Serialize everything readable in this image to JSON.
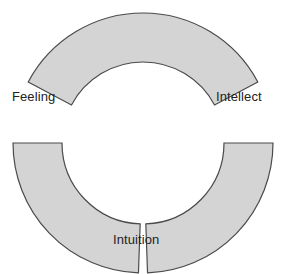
{
  "diagram": {
    "background_color": "#ffffff",
    "center": {
      "x": 143,
      "y": 143
    },
    "radii": {
      "outer": 130,
      "inner": 81
    },
    "segment_fill_color": "#d4d4d4",
    "segment_stroke_color": "#4a4a4a",
    "segment_stroke_width": 1.2,
    "segments": [
      {
        "id": "top-segment",
        "name": "top-arc-segment",
        "position": "top",
        "start_angle_deg": 208,
        "end_angle_deg": 332,
        "fill": "#d4d4d4",
        "stroke": "#4a4a4a"
      },
      {
        "id": "bottom-left-segment",
        "name": "bottom-left-arc-segment",
        "position": "bottom-left",
        "start_angle_deg": 92,
        "end_angle_deg": 180,
        "fill": "#d4d4d4",
        "stroke": "#4a4a4a"
      },
      {
        "id": "bottom-right-segment",
        "name": "bottom-right-arc-segment",
        "position": "bottom-right",
        "start_angle_deg": 0,
        "end_angle_deg": 88,
        "fill": "#d4d4d4",
        "stroke": "#4a4a4a"
      }
    ],
    "labels": {
      "feeling": "Feeling",
      "intellect": "Intellect",
      "intuition": "Intuition"
    },
    "label_color": "#222222"
  }
}
